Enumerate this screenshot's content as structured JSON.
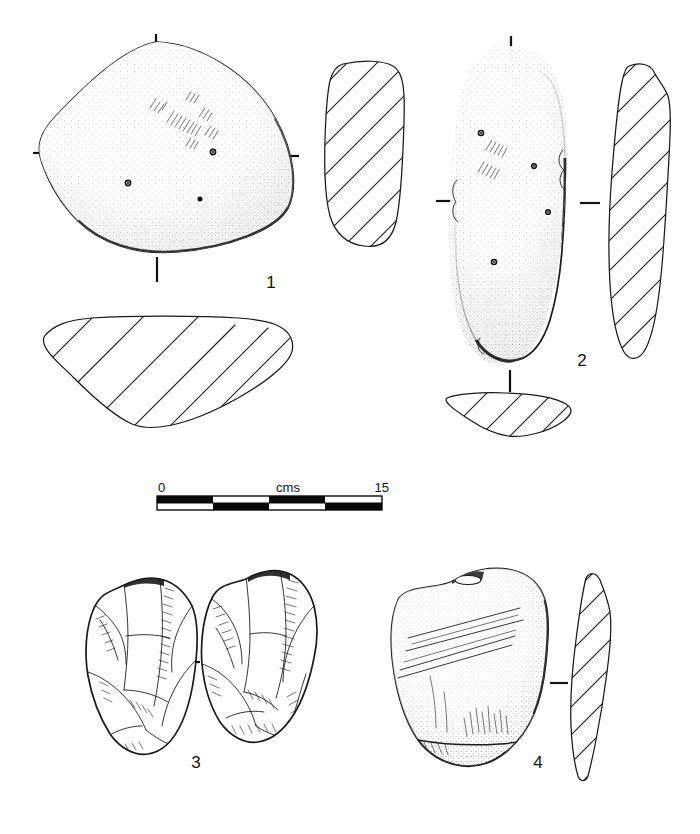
{
  "plate": {
    "title": "Lithic artefact illustration plate",
    "background_color": "#ffffff",
    "ink_color": "#1a1a1a",
    "width": 700,
    "height": 834
  },
  "scale_bar": {
    "name": "scale-bar",
    "unit_label": "cms",
    "start_label": "0",
    "end_label": "15",
    "segments": 4,
    "segment_length_cm": 3.75,
    "total_cm": 15
  },
  "figures": [
    {
      "id": "figure-1",
      "label": "1",
      "description": "Rounded triangular ground-stone artefact, stippled shading, use-wear striations and three small pits",
      "views": [
        "plan",
        "side-section",
        "end-section"
      ],
      "tick_marks": 4
    },
    {
      "id": "figure-2",
      "label": "2",
      "description": "Elongated oval ground-stone artefact with stippled shading, pecked pits and striation groups",
      "views": [
        "plan",
        "long-section",
        "end-section"
      ],
      "tick_marks": 3
    },
    {
      "id": "figure-3",
      "label": "3",
      "description": "Flaked flint core shown in two opposed faces with flake scars and ripple marks",
      "views": [
        "face-a",
        "face-b"
      ],
      "tick_marks": 1
    },
    {
      "id": "figure-4",
      "label": "4",
      "description": "Stone flake with incised parallel striations, shown in plan with narrow profile section",
      "views": [
        "plan",
        "profile-section"
      ],
      "tick_marks": 1
    }
  ]
}
